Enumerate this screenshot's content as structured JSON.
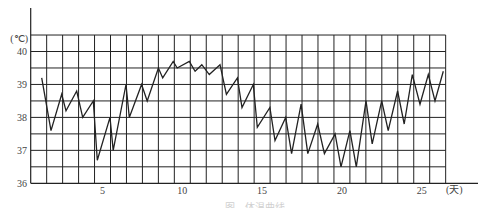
{
  "chart_data": {
    "type": "line",
    "title": "",
    "caption": "图　体温曲线",
    "xlabel": "(天)",
    "ylabel": "(℃)",
    "xlim": [
      0,
      26
    ],
    "ylim": [
      36,
      40.5
    ],
    "grid": true,
    "grid_x_step": 1,
    "grid_y_step": 0.5,
    "x_ticks": [
      5,
      10,
      15,
      20,
      25
    ],
    "x_tick_labels": [
      "5",
      "10",
      "15",
      "20",
      "25"
    ],
    "y_ticks": [
      36,
      37,
      38,
      39,
      40
    ],
    "y_tick_labels": [
      "36",
      "37",
      "38",
      "39",
      "40"
    ],
    "legend": null,
    "series": [
      {
        "name": "体温",
        "color": "#222222",
        "x": [
          1.19,
          1.77,
          2.44,
          2.71,
          3.38,
          3.76,
          4.42,
          4.67,
          5.47,
          5.67,
          6.47,
          6.68,
          7.45,
          7.8,
          8.5,
          8.77,
          9.43,
          9.68,
          10.44,
          10.8,
          11.22,
          11.69,
          12.36,
          12.76,
          13.45,
          13.74,
          14.45,
          14.7,
          15.49,
          15.81,
          16.48,
          16.85,
          17.44,
          17.86,
          18.48,
          18.9,
          19.57,
          19.94,
          20.5,
          20.9,
          21.51,
          21.9,
          22.49,
          22.9,
          23.49,
          23.9,
          24.41,
          24.89,
          25.41,
          25.83,
          26.35
        ],
        "values": [
          39.2,
          37.6,
          38.7,
          38.2,
          38.8,
          38.0,
          38.5,
          36.7,
          38.0,
          37.0,
          39.0,
          38.0,
          39.0,
          38.5,
          39.5,
          39.2,
          39.7,
          39.5,
          39.7,
          39.4,
          39.6,
          39.3,
          39.6,
          38.7,
          39.2,
          38.3,
          39.0,
          37.7,
          38.3,
          37.3,
          38.0,
          36.9,
          38.4,
          36.9,
          37.8,
          36.9,
          37.5,
          36.5,
          37.6,
          36.5,
          38.5,
          37.2,
          38.5,
          37.6,
          38.8,
          37.8,
          39.3,
          38.4,
          39.3,
          38.5,
          39.4
        ]
      }
    ]
  }
}
